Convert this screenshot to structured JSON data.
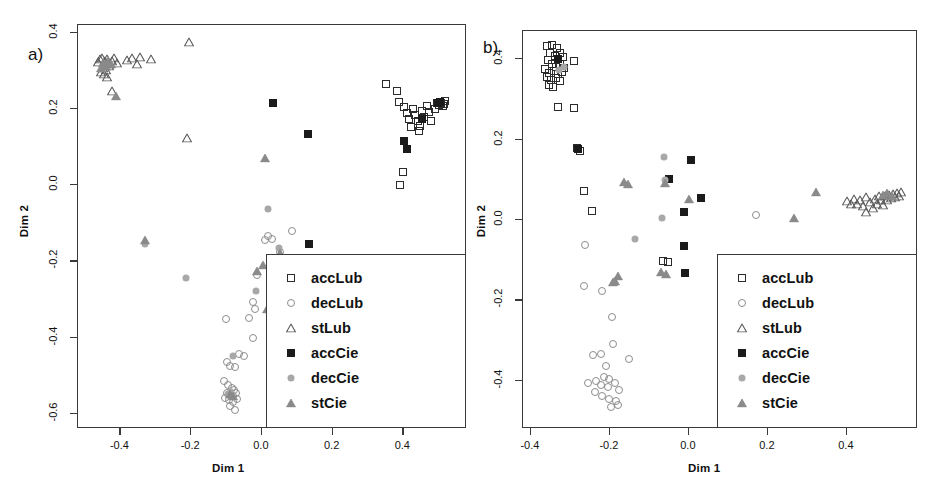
{
  "figure": {
    "width": 946,
    "height": 502,
    "background": "#ffffff"
  },
  "legend_entries": [
    {
      "label": "accLub",
      "marker": "square-open",
      "color": "#2b2b2b"
    },
    {
      "label": "decLub",
      "marker": "circle-open",
      "color": "#8d8d8d"
    },
    {
      "label": "stLub",
      "marker": "triangle-open",
      "color": "#5a5a5a"
    },
    {
      "label": "accCie",
      "marker": "square-filled",
      "color": "#1b1b1b"
    },
    {
      "label": "decCie",
      "marker": "circle-filled",
      "color": "#a8a8a8"
    },
    {
      "label": "stCie",
      "marker": "triangle-filled",
      "color": "#8a8a8a"
    }
  ],
  "chart_data": [
    {
      "type": "scatter",
      "panel": "a",
      "panel_tag": "a)",
      "title": "",
      "xlabel": "Dim 1",
      "ylabel": "Dim 2",
      "xticks": [
        -0.4,
        -0.2,
        0.0,
        0.2,
        0.4
      ],
      "xticklabels": [
        "-0.4",
        "-0.2",
        "0.0",
        "0.2",
        "0.4"
      ],
      "yticks": [
        0.4,
        0.2,
        0.0,
        -0.2,
        -0.4,
        -0.6
      ],
      "yticklabels": [
        "0.4",
        "0.2",
        "0.0",
        "-0.2",
        "-0.4",
        "-0.6"
      ],
      "xlim": [
        -0.52,
        0.58
      ],
      "ylim": [
        -0.64,
        0.42
      ],
      "grid": false,
      "legend_position": "bottom-right",
      "series": [
        {
          "name": "accLub",
          "marker": "square-open",
          "points": [
            [
              0.355,
              0.262
            ],
            [
              0.385,
              0.244
            ],
            [
              0.39,
              0.215
            ],
            [
              0.405,
              0.203
            ],
            [
              0.412,
              0.186
            ],
            [
              0.418,
              0.172
            ],
            [
              0.43,
              0.198
            ],
            [
              0.437,
              0.18
            ],
            [
              0.443,
              0.166
            ],
            [
              0.449,
              0.152
            ],
            [
              0.455,
              0.192
            ],
            [
              0.462,
              0.175
            ],
            [
              0.47,
              0.205
            ],
            [
              0.476,
              0.188
            ],
            [
              0.481,
              0.166
            ],
            [
              0.492,
              0.198
            ],
            [
              0.498,
              0.212
            ],
            [
              0.505,
              0.208
            ],
            [
              0.51,
              0.214
            ],
            [
              0.515,
              0.206
            ],
            [
              0.519,
              0.21
            ],
            [
              0.522,
              0.218
            ],
            [
              0.403,
              0.031
            ],
            [
              0.393,
              -0.003
            ],
            [
              0.447,
              0.14
            ],
            [
              0.425,
              0.151
            ]
          ]
        },
        {
          "name": "decLub",
          "marker": "circle-open",
          "points": [
            [
              0.013,
              -0.148
            ],
            [
              0.021,
              -0.137
            ],
            [
              0.031,
              -0.143
            ],
            [
              0.055,
              -0.178
            ],
            [
              0.06,
              -0.215
            ],
            [
              0.087,
              -0.122
            ],
            [
              -0.012,
              -0.238
            ],
            [
              -0.022,
              -0.309
            ],
            [
              -0.018,
              -0.327
            ],
            [
              -0.035,
              -0.352
            ],
            [
              -0.1,
              -0.354
            ],
            [
              -0.021,
              -0.404
            ],
            [
              -0.062,
              -0.447
            ],
            [
              -0.047,
              -0.452
            ],
            [
              -0.095,
              -0.466
            ],
            [
              -0.086,
              -0.477
            ],
            [
              -0.074,
              -0.479
            ],
            [
              -0.104,
              -0.517
            ],
            [
              -0.092,
              -0.527
            ],
            [
              -0.083,
              -0.536
            ],
            [
              -0.075,
              -0.54
            ],
            [
              -0.097,
              -0.547
            ],
            [
              -0.088,
              -0.553
            ],
            [
              -0.079,
              -0.556
            ],
            [
              -0.07,
              -0.549
            ],
            [
              -0.101,
              -0.56
            ],
            [
              -0.091,
              -0.566
            ],
            [
              -0.08,
              -0.571
            ],
            [
              -0.068,
              -0.563
            ],
            [
              -0.086,
              -0.582
            ],
            [
              -0.073,
              -0.592
            ]
          ]
        },
        {
          "name": "stLub",
          "marker": "triangle-open",
          "points": [
            [
              -0.203,
              0.374
            ],
            [
              -0.462,
              0.32
            ],
            [
              -0.455,
              0.327
            ],
            [
              -0.448,
              0.331
            ],
            [
              -0.441,
              0.322
            ],
            [
              -0.434,
              0.329
            ],
            [
              -0.428,
              0.316
            ],
            [
              -0.421,
              0.324
            ],
            [
              -0.415,
              0.332
            ],
            [
              -0.408,
              0.318
            ],
            [
              -0.446,
              0.305
            ],
            [
              -0.438,
              0.299
            ],
            [
              -0.43,
              0.31
            ],
            [
              -0.452,
              0.295
            ],
            [
              -0.443,
              0.288
            ],
            [
              -0.436,
              0.281
            ],
            [
              -0.378,
              0.326
            ],
            [
              -0.364,
              0.332
            ],
            [
              -0.35,
              0.316
            ],
            [
              -0.341,
              0.334
            ],
            [
              -0.311,
              0.328
            ],
            [
              -0.421,
              0.244
            ],
            [
              -0.209,
              0.122
            ]
          ]
        },
        {
          "name": "accCie",
          "marker": "square-filled",
          "points": [
            [
              0.033,
              0.214
            ],
            [
              0.133,
              0.132
            ],
            [
              0.405,
              0.114
            ],
            [
              0.412,
              0.091
            ],
            [
              0.455,
              0.17
            ],
            [
              0.5,
              0.212
            ],
            [
              0.507,
              0.215
            ],
            [
              0.135,
              -0.158
            ]
          ]
        },
        {
          "name": "decCie",
          "marker": "circle-filled",
          "points": [
            [
              -0.327,
              -0.157
            ],
            [
              -0.213,
              -0.246
            ],
            [
              0.02,
              -0.066
            ],
            [
              0.052,
              -0.167
            ],
            [
              -0.013,
              -0.281
            ],
            [
              -0.079,
              -0.45
            ],
            [
              -0.094,
              -0.552
            ],
            [
              -0.085,
              -0.546
            ]
          ]
        },
        {
          "name": "stCie",
          "marker": "triangle-filled",
          "points": [
            [
              -0.409,
              0.231
            ],
            [
              -0.446,
              0.318
            ],
            [
              -0.439,
              0.311
            ],
            [
              -0.452,
              0.304
            ],
            [
              -0.432,
              0.323
            ],
            [
              -0.425,
              0.314
            ],
            [
              -0.327,
              -0.148
            ],
            [
              0.013,
              0.068
            ],
            [
              -0.01,
              -0.229
            ],
            [
              0.006,
              -0.213
            ],
            [
              0.055,
              -0.18
            ],
            [
              0.017,
              -0.327
            ],
            [
              -0.088,
              -0.55
            ],
            [
              -0.08,
              -0.556
            ]
          ]
        }
      ]
    },
    {
      "type": "scatter",
      "panel": "b",
      "panel_tag": "b)",
      "title": "",
      "xlabel": "Dim 1",
      "ylabel": "Dim 2",
      "xticks": [
        -0.4,
        -0.2,
        0.0,
        0.2,
        0.4
      ],
      "xticklabels": [
        "-0.4",
        "-0.2",
        "0.0",
        "0.2",
        "0.4"
      ],
      "yticks": [
        0.4,
        0.2,
        0.0,
        -0.2,
        -0.4
      ],
      "yticklabels": [
        "0.4",
        "0.2",
        "0.0",
        "-0.2",
        "-0.4"
      ],
      "xlim": [
        -0.42,
        0.58
      ],
      "ylim": [
        -0.52,
        0.47
      ],
      "grid": false,
      "legend_position": "bottom-right",
      "series": [
        {
          "name": "accLub",
          "marker": "square-open",
          "points": [
            [
              -0.357,
              0.43
            ],
            [
              -0.343,
              0.433
            ],
            [
              -0.331,
              0.424
            ],
            [
              -0.349,
              0.414
            ],
            [
              -0.337,
              0.405
            ],
            [
              -0.325,
              0.412
            ],
            [
              -0.316,
              0.403
            ],
            [
              -0.355,
              0.395
            ],
            [
              -0.345,
              0.386
            ],
            [
              -0.334,
              0.378
            ],
            [
              -0.323,
              0.385
            ],
            [
              -0.313,
              0.376
            ],
            [
              -0.361,
              0.372
            ],
            [
              -0.351,
              0.364
            ],
            [
              -0.34,
              0.369
            ],
            [
              -0.329,
              0.36
            ],
            [
              -0.318,
              0.366
            ],
            [
              -0.357,
              0.352
            ],
            [
              -0.346,
              0.345
            ],
            [
              -0.335,
              0.351
            ],
            [
              -0.324,
              0.342
            ],
            [
              -0.352,
              0.334
            ],
            [
              -0.341,
              0.328
            ],
            [
              -0.288,
              0.392
            ],
            [
              -0.33,
              0.278
            ],
            [
              -0.288,
              0.277
            ],
            [
              -0.281,
              0.177
            ],
            [
              -0.273,
              0.168
            ],
            [
              -0.263,
              0.07
            ],
            [
              -0.242,
              0.021
            ],
            [
              -0.062,
              -0.105
            ],
            [
              -0.05,
              -0.106
            ]
          ]
        },
        {
          "name": "decLub",
          "marker": "circle-open",
          "points": [
            [
              -0.261,
              -0.065
            ],
            [
              -0.263,
              -0.167
            ],
            [
              -0.218,
              -0.18
            ],
            [
              -0.192,
              -0.243
            ],
            [
              -0.189,
              -0.311
            ],
            [
              -0.239,
              -0.338
            ],
            [
              -0.219,
              -0.335
            ],
            [
              -0.148,
              -0.348
            ],
            [
              -0.208,
              -0.366
            ],
            [
              -0.254,
              -0.407
            ],
            [
              -0.232,
              -0.403
            ],
            [
              -0.212,
              -0.392
            ],
            [
              -0.2,
              -0.398
            ],
            [
              -0.221,
              -0.414
            ],
            [
              -0.203,
              -0.419
            ],
            [
              -0.185,
              -0.409
            ],
            [
              -0.174,
              -0.425
            ],
            [
              -0.236,
              -0.43
            ],
            [
              -0.217,
              -0.441
            ],
            [
              -0.199,
              -0.448
            ],
            [
              -0.181,
              -0.452
            ],
            [
              -0.194,
              -0.468
            ],
            [
              -0.176,
              -0.463
            ],
            [
              0.172,
              0.011
            ],
            [
              0.101,
              -0.133
            ]
          ]
        },
        {
          "name": "stLub",
          "marker": "triangle-open",
          "points": [
            [
              0.403,
              0.044
            ],
            [
              0.412,
              0.038
            ],
            [
              0.42,
              0.049
            ],
            [
              0.428,
              0.036
            ],
            [
              0.436,
              0.046
            ],
            [
              0.444,
              0.033
            ],
            [
              0.452,
              0.055
            ],
            [
              0.46,
              0.041
            ],
            [
              0.468,
              0.027
            ],
            [
              0.473,
              0.05
            ],
            [
              0.478,
              0.038
            ],
            [
              0.484,
              0.058
            ],
            [
              0.489,
              0.046
            ],
            [
              0.494,
              0.035
            ],
            [
              0.499,
              0.056
            ],
            [
              0.504,
              0.047
            ],
            [
              0.509,
              0.06
            ],
            [
              0.514,
              0.052
            ],
            [
              0.519,
              0.063
            ],
            [
              0.524,
              0.055
            ],
            [
              0.529,
              0.065
            ],
            [
              0.534,
              0.058
            ],
            [
              0.539,
              0.068
            ],
            [
              0.452,
              0.018
            ]
          ]
        },
        {
          "name": "accCie",
          "marker": "square-filled",
          "points": [
            [
              0.007,
              0.146
            ],
            [
              0.033,
              0.051
            ],
            [
              -0.009,
              0.017
            ],
            [
              -0.049,
              0.1
            ],
            [
              -0.01,
              -0.068
            ],
            [
              -0.007,
              -0.135
            ],
            [
              -0.33,
              0.399
            ],
            [
              -0.277,
              0.174
            ]
          ]
        },
        {
          "name": "decCie",
          "marker": "circle-filled",
          "points": [
            [
              -0.061,
              0.155
            ],
            [
              -0.066,
              0.003
            ],
            [
              -0.134,
              -0.049
            ],
            [
              -0.058,
              0.097
            ],
            [
              0.218,
              -0.103
            ],
            [
              0.145,
              -0.152
            ],
            [
              -0.313,
              0.378
            ],
            [
              -0.327,
              0.37
            ]
          ]
        },
        {
          "name": "stCie",
          "marker": "triangle-filled",
          "points": [
            [
              0.324,
              0.068
            ],
            [
              0.268,
              0.003
            ],
            [
              -0.161,
              0.092
            ],
            [
              -0.151,
              0.088
            ],
            [
              -0.058,
              0.09
            ],
            [
              0.002,
              0.05
            ],
            [
              -0.178,
              -0.142
            ],
            [
              -0.068,
              -0.133
            ],
            [
              -0.056,
              -0.136
            ],
            [
              -0.19,
              -0.158
            ],
            [
              -0.184,
              -0.155
            ],
            [
              0.494,
              0.06
            ],
            [
              0.505,
              0.064
            ],
            [
              0.516,
              0.058
            ]
          ]
        }
      ]
    }
  ]
}
